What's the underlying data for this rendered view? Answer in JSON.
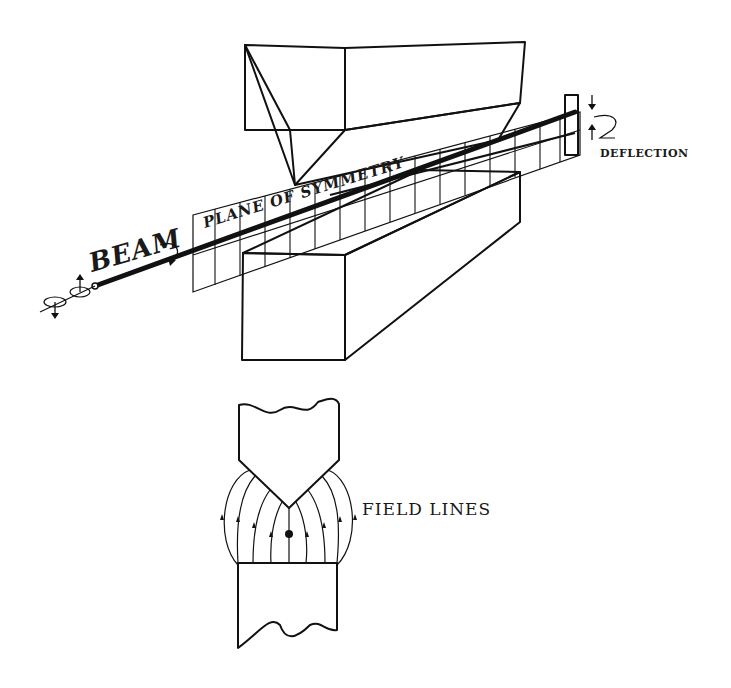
{
  "diagram": {
    "upper_view": {
      "labels": {
        "beam": "BEAM",
        "plane": "PLANE OF SYMMETRY",
        "deflection": "DEFLECTION"
      },
      "components": [
        {
          "name": "upper-pole-piece",
          "shape": "wedge (knife-edge) magnet pole"
        },
        {
          "name": "lower-pole-piece",
          "shape": "flat rectangular magnet pole"
        },
        {
          "name": "plane-of-symmetry",
          "shape": "vertical ruled plane"
        },
        {
          "name": "beam",
          "shape": "thick line through gap"
        },
        {
          "name": "detector-plate",
          "shape": "hatched plate"
        }
      ]
    },
    "lower_view": {
      "labels": {
        "field_lines": "FIELD LINES"
      },
      "components": [
        {
          "name": "upper-pole-cross-section",
          "shape": "pointed pole"
        },
        {
          "name": "lower-pole-cross-section",
          "shape": "flat pole"
        },
        {
          "name": "field-lines",
          "count": 8
        },
        {
          "name": "beam-cross-section",
          "shape": "dot"
        }
      ]
    },
    "colors": {
      "ink": "#111111",
      "background": "#ffffff"
    }
  }
}
